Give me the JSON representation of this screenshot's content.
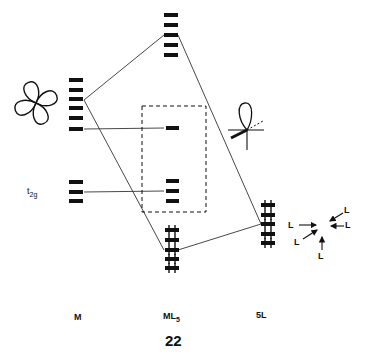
{
  "figure": {
    "number": "22",
    "columns": [
      {
        "id": "M",
        "label": "M"
      },
      {
        "id": "ML5",
        "label_main": "ML",
        "label_sub": "5"
      },
      {
        "id": "5L",
        "label": "5L"
      }
    ],
    "t2g_label_main": "t",
    "t2g_label_sub": "2g",
    "ligand_label": "L",
    "ligands": [
      "L",
      "L",
      "L",
      "L",
      "L"
    ],
    "levels": {
      "M_d_set_upper": 6,
      "M_t2g": 3,
      "ML5_top": 5,
      "ML5_frontier_single": 1,
      "ML5_t2g": 3,
      "ML5_bottom_filled": 5,
      "5L_filled": 5
    },
    "colors": {
      "ink": "#111111",
      "line": "#333333",
      "background": "#ffffff"
    }
  }
}
